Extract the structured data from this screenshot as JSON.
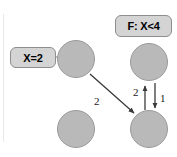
{
  "diagram": {
    "background": "#ffffff",
    "node_fill": "#b9b9b9",
    "node_stroke": "#9a9a9a",
    "tag_fill": "#d4d4d4",
    "tag_stroke": "#8e8e8e",
    "arrow_color": "#3a3a3a",
    "nodes": [
      {
        "id": "n-top-left",
        "label": "",
        "cx": 76,
        "cy": 59,
        "r": 19
      },
      {
        "id": "n-bottom-left",
        "label": "",
        "cx": 76,
        "cy": 129,
        "r": 19
      },
      {
        "id": "n-top-right",
        "label": "",
        "cx": 149,
        "cy": 62,
        "r": 19
      },
      {
        "id": "n-bottom-right",
        "label": "",
        "cx": 149,
        "cy": 129,
        "r": 19
      }
    ],
    "tags": [
      {
        "id": "tag-assignment",
        "text": "X=2"
      },
      {
        "id": "tag-constraint",
        "text": "F: X<4"
      }
    ],
    "edges": [
      {
        "id": "edge-diagonal",
        "label": "2",
        "from": "n-top-left",
        "to": "n-bottom-right",
        "direction": "down-right"
      },
      {
        "id": "edge-up",
        "label": "2",
        "from": "n-bottom-right",
        "to": "n-top-right",
        "direction": "up"
      },
      {
        "id": "edge-down",
        "label": "1",
        "from": "n-top-right",
        "to": "n-bottom-right",
        "direction": "down"
      }
    ]
  }
}
